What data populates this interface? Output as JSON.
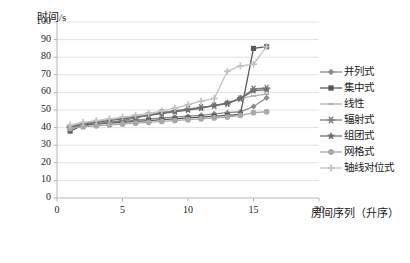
{
  "chart_data": {
    "type": "line",
    "title": "",
    "xlabel": "房间序列（升序）",
    "ylabel": "时间/s",
    "xlim": [
      0,
      20
    ],
    "ylim": [
      0,
      100
    ],
    "xticks": [
      0,
      5,
      10,
      15,
      20
    ],
    "yticks": [
      0,
      10,
      20,
      30,
      40,
      50,
      60,
      70,
      80,
      90,
      100
    ],
    "grid": true,
    "legend_position": "right",
    "x": [
      1,
      2,
      3,
      4,
      5,
      6,
      7,
      8,
      9,
      10,
      11,
      12,
      13,
      14,
      15,
      16
    ],
    "series": [
      {
        "name": "并列式",
        "marker": "diamond",
        "color": "#8b8b8b",
        "values": [
          40.5,
          42.0,
          42.5,
          43.0,
          43.5,
          44.2,
          45.0,
          45.5,
          46.0,
          46.5,
          47.0,
          47.8,
          48.5,
          49.0,
          52.0,
          57.0
        ]
      },
      {
        "name": "集中式",
        "marker": "square",
        "color": "#595959",
        "values": [
          38.0,
          41.5,
          42.0,
          42.5,
          43.0,
          43.5,
          44.0,
          44.5,
          45.0,
          45.5,
          46.0,
          46.5,
          47.0,
          47.5,
          85.0,
          86.0
        ]
      },
      {
        "name": "线性",
        "marker": "dash",
        "color": "#b0b0b0",
        "values": [
          41.0,
          42.5,
          43.5,
          44.5,
          45.5,
          46.5,
          47.5,
          48.5,
          49.5,
          50.5,
          51.5,
          52.5,
          54.0,
          56.5,
          58.0,
          59.0
        ]
      },
      {
        "name": "辐射式",
        "marker": "asterisk",
        "color": "#7d7d7d",
        "values": [
          40.0,
          41.0,
          42.0,
          43.0,
          44.0,
          45.5,
          47.0,
          48.5,
          49.5,
          50.5,
          51.5,
          52.5,
          53.5,
          56.5,
          62.0,
          62.5
        ]
      },
      {
        "name": "组团式",
        "marker": "star",
        "color": "#6f6f6f",
        "values": [
          40.2,
          42.0,
          43.0,
          44.0,
          45.0,
          46.0,
          47.0,
          48.0,
          49.0,
          50.0,
          51.0,
          52.5,
          54.0,
          56.5,
          61.0,
          61.5
        ]
      },
      {
        "name": "网格式",
        "marker": "circle",
        "color": "#a8a8a8",
        "values": [
          39.5,
          40.5,
          41.0,
          41.5,
          42.0,
          42.5,
          43.0,
          43.5,
          44.0,
          44.5,
          45.0,
          45.5,
          46.0,
          47.0,
          48.5,
          49.0
        ]
      },
      {
        "name": "轴线对位式",
        "marker": "plus",
        "color": "#c2c2c2",
        "values": [
          41.5,
          43.0,
          44.0,
          45.0,
          46.0,
          47.0,
          48.0,
          49.5,
          51.0,
          53.0,
          55.0,
          56.5,
          72.0,
          75.0,
          76.0,
          86.0
        ]
      }
    ]
  }
}
